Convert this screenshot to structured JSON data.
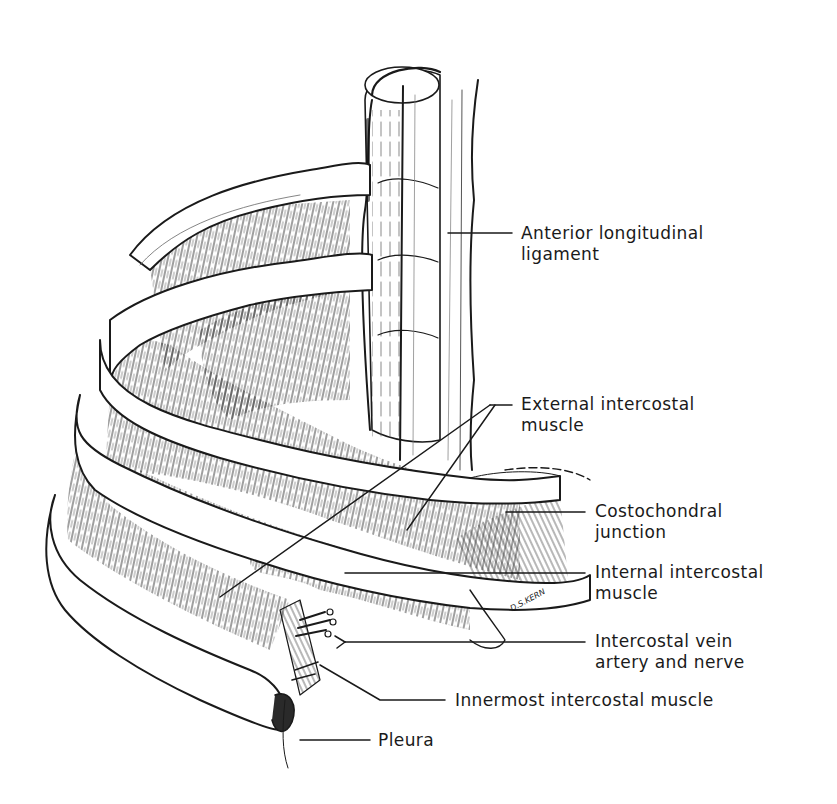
{
  "figure": {
    "type": "anatomical-line-drawing",
    "background": "#ffffff",
    "ink": "#1a1a1a"
  },
  "labels": [
    {
      "id": "anterior-longitudinal-ligament",
      "line1": "Anterior longitudinal",
      "line2": "ligament",
      "x": 521,
      "y": 225
    },
    {
      "id": "external-intercostal-muscle",
      "line1": "External intercostal",
      "line2": "muscle",
      "x": 521,
      "y": 396
    },
    {
      "id": "costochondral-junction",
      "line1": "Costochondral",
      "line2": "junction",
      "x": 595,
      "y": 503
    },
    {
      "id": "internal-intercostal-muscle",
      "line1": "Internal intercostal",
      "line2": "muscle",
      "x": 595,
      "y": 562
    },
    {
      "id": "intercostal-vein-artery-nerve",
      "line1": "Intercostal vein",
      "line2": "artery and nerve",
      "x": 595,
      "y": 632
    },
    {
      "id": "innermost-intercostal-muscle",
      "line1": "Innermost intercostal muscle",
      "line2": "",
      "x": 455,
      "y": 693
    },
    {
      "id": "pleura",
      "line1": "Pleura",
      "line2": "",
      "x": 378,
      "y": 733
    }
  ],
  "signature": {
    "text": "D.S.KERN",
    "x": 513,
    "y": 614
  }
}
